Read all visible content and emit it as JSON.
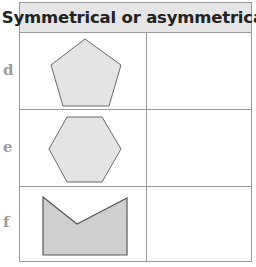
{
  "table": {
    "header": "Symmetrical or asymmetrical",
    "rows": [
      {
        "label": "d",
        "shape": "pentagon-icon",
        "answer": ""
      },
      {
        "label": "e",
        "shape": "hexagon-icon",
        "answer": ""
      },
      {
        "label": "f",
        "shape": "notched-rectangle-icon",
        "answer": ""
      }
    ]
  },
  "colors": {
    "border": "#9a9a9a",
    "header_bg": "#e6e6e6",
    "light_fill": "#e4e4e4",
    "dark_fill": "#cfcfcf",
    "label": "#9c9c9c",
    "stroke": "#666666"
  }
}
